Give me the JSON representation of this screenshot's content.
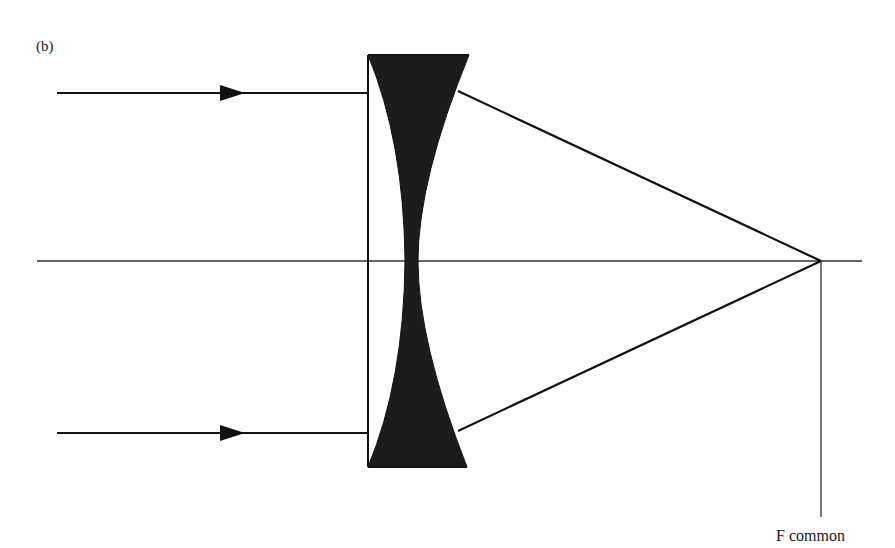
{
  "diagram": {
    "panel_label": "(b)",
    "focal_label": "F common",
    "colors": {
      "ink": "#111111",
      "lens_fill": "#1c1c1c",
      "axis": "#333333",
      "background": "#ffffff"
    },
    "elements": {
      "optical_axis": {
        "x1": 37,
        "y1": 261,
        "x2": 862,
        "y2": 261
      },
      "focal_point": {
        "x": 821,
        "y": 261
      },
      "focal_marker_line": {
        "x": 821,
        "y1": 261,
        "y2": 517
      },
      "lens_flat_face_x": 368,
      "lens_top_y": 55,
      "lens_bottom_y": 467,
      "incoming_rays": [
        {
          "y": 93,
          "x_start": 57,
          "x_end": 368,
          "arrow_x": 232
        },
        {
          "y": 433,
          "x_start": 57,
          "x_end": 368,
          "arrow_x": 232
        }
      ],
      "outgoing_rays": [
        {
          "x1": 458,
          "y1": 91,
          "x2": 821,
          "y2": 261
        },
        {
          "x1": 458,
          "y1": 431,
          "x2": 821,
          "y2": 261
        }
      ]
    }
  }
}
